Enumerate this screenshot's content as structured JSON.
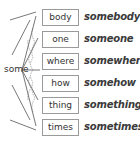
{
  "diagram": {
    "root_word": "some",
    "suffixes": [
      "body",
      "one",
      "where",
      "how",
      "thing",
      "times"
    ],
    "compounds": [
      "somebody",
      "someone",
      "somewhere",
      "somehow",
      "something",
      "sometimes"
    ],
    "colors": {
      "box_border": "#9a9a9a",
      "text": "#333333",
      "web_lines": "#555555"
    }
  }
}
